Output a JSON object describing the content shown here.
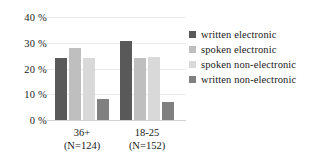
{
  "chart_data": {
    "type": "bar",
    "title": "",
    "xlabel": "",
    "ylabel": "",
    "ylim": [
      0,
      40
    ],
    "grid": true,
    "legend_position": "right",
    "categories": [
      "36+\n(N=124)",
      "18-25\n(N=152)"
    ],
    "category_lines": [
      {
        "line1": "36+",
        "line2": "(N=124)"
      },
      {
        "line1": "18-25",
        "line2": "(N=152)"
      }
    ],
    "yticks": [
      "0 %",
      "10 %",
      "20 %",
      "30 %",
      "40 %"
    ],
    "ytick_values": [
      0,
      10,
      20,
      30,
      40
    ],
    "series": [
      {
        "name": "written electronic",
        "color": "#595959",
        "values": [
          24,
          30.5
        ]
      },
      {
        "name": "spoken electronic",
        "color": "#bfbfbf",
        "values": [
          28,
          24
        ]
      },
      {
        "name": "spoken non-electronic",
        "color": "#d9d9d9",
        "values": [
          24,
          24.5
        ]
      },
      {
        "name": "written non-electronic",
        "color": "#808080",
        "values": [
          8,
          7
        ]
      }
    ]
  },
  "legend": {
    "items": [
      {
        "label": "written electronic",
        "color": "#595959"
      },
      {
        "label": "spoken electronic",
        "color": "#bfbfbf"
      },
      {
        "label": "spoken non-electronic",
        "color": "#d9d9d9"
      },
      {
        "label": "written non-electronic",
        "color": "#808080"
      }
    ]
  }
}
